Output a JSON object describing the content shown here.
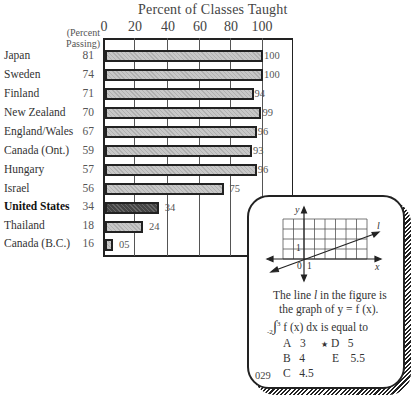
{
  "chart_data": {
    "type": "bar",
    "orientation": "horizontal",
    "title": "Percent of Classes Taught",
    "xlabel": "Percent of Classes Taught",
    "ylabel": "",
    "xlim": [
      0,
      100
    ],
    "x_ticks": [
      "0",
      "20",
      "40",
      "60",
      "80",
      "100"
    ],
    "secondary_column_header": "(Percent Passing)",
    "categories": [
      "Japan",
      "Sweden",
      "Finland",
      "New Zealand",
      "England/Wales",
      "Canada (Ont.)",
      "Hungary",
      "Israel",
      "United States",
      "Thailand",
      "Canada (B.C.)"
    ],
    "series": [
      {
        "name": "Percent of Classes Taught",
        "values": [
          100,
          100,
          94,
          99,
          96,
          93,
          96,
          75,
          34,
          24,
          5
        ]
      },
      {
        "name": "Percent Passing",
        "values": [
          81,
          74,
          71,
          70,
          67,
          59,
          57,
          56,
          34,
          18,
          16
        ]
      }
    ],
    "value_labels": [
      "100",
      "100",
      "94",
      "99",
      "96",
      "93",
      "96",
      "75",
      "34",
      "24",
      "05"
    ],
    "highlighted_category": "United States",
    "grid": true,
    "legend": "none"
  },
  "header": {
    "title": "Percent of Classes Taught",
    "ticks": [
      "0",
      "20",
      "40",
      "60",
      "80",
      "100"
    ],
    "passing_header_line1": "(Percent",
    "passing_header_line2": "Passing)"
  },
  "rows": [
    {
      "country": "Japan",
      "passing": "81",
      "taught": 100,
      "label": "100"
    },
    {
      "country": "Sweden",
      "passing": "74",
      "taught": 100,
      "label": "100"
    },
    {
      "country": "Finland",
      "passing": "71",
      "taught": 94,
      "label": "94"
    },
    {
      "country": "New Zealand",
      "passing": "70",
      "taught": 99,
      "label": "99"
    },
    {
      "country": "England/Wales",
      "passing": "67",
      "taught": 96,
      "label": "96"
    },
    {
      "country": "Canada (Ont.)",
      "passing": "59",
      "taught": 93,
      "label": "93"
    },
    {
      "country": "Hungary",
      "passing": "57",
      "taught": 96,
      "label": "96"
    },
    {
      "country": "Israel",
      "passing": "56",
      "taught": 75,
      "label": "75"
    },
    {
      "country": "United States",
      "passing": "34",
      "taught": 34,
      "label": "34"
    },
    {
      "country": "Thailand",
      "passing": "18",
      "taught": 24,
      "label": "24"
    },
    {
      "country": "Canada (B.C.)",
      "passing": "16",
      "taught": 5,
      "label": "05"
    }
  ],
  "question_card": {
    "graph": {
      "y_axis_label": "y",
      "x_axis_label": "x",
      "line_label": "l",
      "origin_label": "0",
      "x_one_label": "1",
      "y_one_label": "1"
    },
    "line1": "The line",
    "line1_var": "l",
    "line1_rest": "in the figure is",
    "line2": "the graph of y = f (x).",
    "integral_lower": "-2",
    "integral_upper": "3",
    "integral_text": "f (x) dx is equal to",
    "choices": [
      {
        "letter": "A",
        "value": "3",
        "correct": false
      },
      {
        "letter": "B",
        "value": "4",
        "correct": false
      },
      {
        "letter": "C",
        "value": "4.5",
        "correct": false
      },
      {
        "letter": "D",
        "value": "5",
        "correct": true
      },
      {
        "letter": "E",
        "value": "5.5",
        "correct": false
      }
    ],
    "correct_marker": "★",
    "item_number": "029"
  }
}
